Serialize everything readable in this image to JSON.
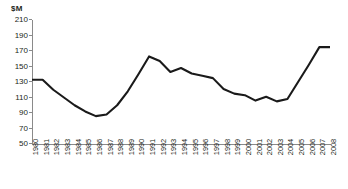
{
  "chart_data": {
    "type": "line",
    "title": "",
    "subtitle": "",
    "unit_label": "$M",
    "xlabel": "",
    "ylabel": "$M",
    "ylim": [
      50,
      210
    ],
    "ytick_step": 20,
    "yticks": [
      210,
      190,
      170,
      150,
      130,
      110,
      90,
      70,
      50
    ],
    "grid": false,
    "legend": "none",
    "line_color": "#1a1a1a",
    "axis_color": "#8a8a8a",
    "categories": [
      "1980",
      "1981",
      "1982",
      "1983",
      "1984",
      "1985",
      "1986",
      "1987",
      "1988",
      "1989",
      "1990",
      "1991",
      "1992",
      "1993",
      "1994",
      "1995",
      "1996",
      "1997",
      "1998",
      "1999",
      "2000",
      "2001",
      "2002",
      "2003",
      "2004",
      "2005",
      "2006",
      "2007",
      "2008"
    ],
    "values": [
      133,
      133,
      120,
      110,
      100,
      92,
      86,
      88,
      100,
      118,
      140,
      163,
      157,
      143,
      148,
      141,
      138,
      135,
      121,
      115,
      113,
      106,
      111,
      105,
      108,
      130,
      152,
      175,
      175
    ],
    "series": [
      {
        "name": "value",
        "values": [
          133,
          133,
          120,
          110,
          100,
          92,
          86,
          88,
          100,
          118,
          140,
          163,
          157,
          143,
          148,
          141,
          138,
          135,
          121,
          115,
          113,
          106,
          111,
          105,
          108,
          130,
          152,
          175,
          175
        ]
      }
    ]
  }
}
